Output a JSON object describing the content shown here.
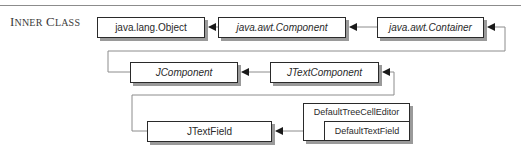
{
  "section": {
    "label_initial_1": "I",
    "label_rest_1": "NNER",
    "label_initial_2": "C",
    "label_rest_2": "LASS"
  },
  "diagram": {
    "type": "class-inheritance-hierarchy",
    "nodes": [
      {
        "id": "object",
        "label": "java.lang.Object",
        "style": "normal"
      },
      {
        "id": "component",
        "label": "java.awt.Component",
        "style": "italic"
      },
      {
        "id": "container",
        "label": "java.awt.Container",
        "style": "italic"
      },
      {
        "id": "jcomponent",
        "label": "JComponent",
        "style": "italic"
      },
      {
        "id": "jtextcomponent",
        "label": "JTextComponent",
        "style": "italic"
      },
      {
        "id": "jtextfield",
        "label": "JTextField",
        "style": "normal"
      },
      {
        "id": "defaulttreecelleditor",
        "label": "DefaultTreeCellEditor",
        "style": "normal"
      },
      {
        "id": "defaulttextfield",
        "label": "DefaultTextField",
        "style": "normal",
        "nested_in": "defaulttreecelleditor"
      }
    ],
    "edges": [
      {
        "from": "component",
        "to": "object"
      },
      {
        "from": "container",
        "to": "component"
      },
      {
        "from": "jcomponent",
        "to": "container"
      },
      {
        "from": "jtextcomponent",
        "to": "jcomponent"
      },
      {
        "from": "jtextfield",
        "to": "jtextcomponent"
      },
      {
        "from": "defaulttextfield",
        "to": "jtextfield"
      }
    ],
    "colors": {
      "border": "#2a2a2a",
      "shadow": "#9a9a9a",
      "connector": "#8c8c8c",
      "arrowhead": "#1a1a1a"
    }
  }
}
